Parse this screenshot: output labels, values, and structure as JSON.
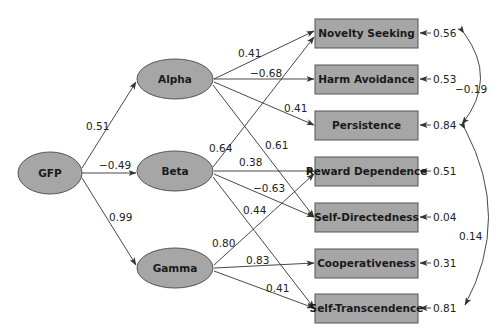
{
  "diagram": {
    "type": "path-model",
    "colors": {
      "node_fill": "#a6a6a6",
      "node_stroke": "#555555",
      "edge": "#333333",
      "text": "#222222"
    },
    "latent": {
      "gfp": "GFP",
      "alpha": "Alpha",
      "beta": "Beta",
      "gamma": "Gamma"
    },
    "observed": {
      "ns": "Novelty Seeking",
      "ha": "Harm Avoidance",
      "p": "Persistence",
      "rd": "Reward Dependence",
      "sd": "Self-Directedness",
      "c": "Cooperativeness",
      "st": "Self-Transcendence"
    },
    "gfp_paths": {
      "alpha": "0.51",
      "beta": "−0.49",
      "gamma": "0.99"
    },
    "alpha_paths": {
      "ns": "0.41",
      "ha": "−0.68",
      "p": "0.41",
      "sd": "0.61"
    },
    "beta_paths": {
      "ns": "0.64",
      "rd": "0.38",
      "sd": "−0.63",
      "st": "0.44"
    },
    "gamma_paths": {
      "rd": "0.80",
      "c": "0.83",
      "st": "0.41"
    },
    "residuals": {
      "ns": "0.56",
      "ha": "0.53",
      "p": "0.84",
      "rd": "0.51",
      "sd": "0.04",
      "c": "0.31",
      "st": "0.81"
    },
    "correlations": {
      "ns_p": "−0.19",
      "p_st": "0.14"
    }
  }
}
